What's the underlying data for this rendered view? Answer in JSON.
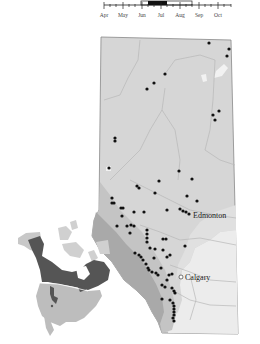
{
  "phenology": {
    "months": [
      "Apr",
      "May",
      "Jun",
      "Jul",
      "Aug",
      "Sep",
      "Oct"
    ],
    "flight_period_range": [
      "Jun",
      "Aug"
    ],
    "peak_period": [
      "mid-Jun",
      "early-Jul"
    ]
  },
  "map": {
    "region": "Alberta",
    "labels": {
      "city1": "Edmonton",
      "city2": "Calgary"
    },
    "colors": {
      "province_fill": "#d6d6d6",
      "mountain_fill": "#a9a9a9",
      "foothill_fill": "#c4c4c4",
      "grassland_fill": "#ececec",
      "record_dot": "#111111",
      "river": "#b8b8b8"
    },
    "records": [
      [
        209,
        43
      ],
      [
        229,
        49
      ],
      [
        227,
        56
      ],
      [
        165,
        74
      ],
      [
        154,
        83
      ],
      [
        147,
        89
      ],
      [
        219,
        111
      ],
      [
        213,
        115
      ],
      [
        215,
        120
      ],
      [
        115,
        138
      ],
      [
        115,
        141
      ],
      [
        109,
        168
      ],
      [
        179,
        171
      ],
      [
        159,
        181
      ],
      [
        192,
        179
      ],
      [
        137,
        186
      ],
      [
        139,
        188
      ],
      [
        155,
        193
      ],
      [
        187,
        196
      ],
      [
        197,
        201
      ],
      [
        112,
        198
      ],
      [
        112,
        203
      ],
      [
        114,
        203
      ],
      [
        121,
        208
      ],
      [
        123,
        208
      ],
      [
        134,
        212
      ],
      [
        144,
        212
      ],
      [
        167,
        210
      ],
      [
        180,
        209
      ],
      [
        183,
        211
      ],
      [
        186,
        212
      ],
      [
        189,
        214
      ],
      [
        122,
        216
      ],
      [
        117,
        226
      ],
      [
        127,
        226
      ],
      [
        131,
        225
      ],
      [
        134,
        226
      ],
      [
        130,
        233
      ],
      [
        147,
        230
      ],
      [
        147,
        234
      ],
      [
        147,
        238
      ],
      [
        147,
        242
      ],
      [
        163,
        239
      ],
      [
        166,
        239
      ],
      [
        185,
        246
      ],
      [
        150,
        248
      ],
      [
        155,
        249
      ],
      [
        163,
        250
      ],
      [
        135,
        253
      ],
      [
        139,
        255
      ],
      [
        141,
        257
      ],
      [
        143,
        260
      ],
      [
        154,
        258
      ],
      [
        167,
        257
      ],
      [
        161,
        268
      ],
      [
        170,
        255
      ],
      [
        146,
        264
      ],
      [
        148,
        268
      ],
      [
        149,
        270
      ],
      [
        152,
        272
      ],
      [
        156,
        273
      ],
      [
        158,
        275
      ],
      [
        169,
        275
      ],
      [
        172,
        274
      ],
      [
        167,
        280
      ],
      [
        162,
        285
      ],
      [
        165,
        287
      ],
      [
        172,
        288
      ],
      [
        174,
        291
      ],
      [
        175,
        293
      ],
      [
        162,
        299
      ],
      [
        170,
        300
      ],
      [
        173,
        303
      ],
      [
        174,
        306
      ],
      [
        174,
        309
      ],
      [
        174,
        312
      ],
      [
        174,
        315
      ],
      [
        173,
        318
      ],
      [
        174,
        321
      ]
    ]
  },
  "inset": {
    "title": "North America range",
    "colors": {
      "range_fill": "#555555",
      "land_fill": "#bdbdbd",
      "land_light": "#d0d0d0"
    }
  }
}
